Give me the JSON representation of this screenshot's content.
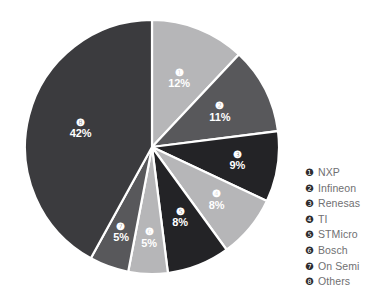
{
  "chart_data": {
    "type": "pie",
    "title": "",
    "subtitle": "",
    "xlabel": "",
    "ylabel": "",
    "grid": false,
    "legend_position": "right",
    "start_angle_deg": 0,
    "direction": "clockwise",
    "categories": [
      "NXP",
      "Infineon",
      "Renesas",
      "TI",
      "STMicro",
      "Bosch",
      "On Semi",
      "Others"
    ],
    "values": [
      12,
      11,
      9,
      8,
      8,
      5,
      5,
      42
    ],
    "value_labels": [
      "12%",
      "11%",
      "9%",
      "8%",
      "8%",
      "5%",
      "5%",
      "42%"
    ],
    "slice_markers": [
      "❶",
      "❷",
      "❸",
      "❹",
      "❺",
      "❻",
      "❼",
      "❽"
    ],
    "colors": [
      "#b6b6b8",
      "#58585b",
      "#232326",
      "#b6b6b8",
      "#232326",
      "#b6b6b8",
      "#58585b",
      "#3b3b3e"
    ],
    "slices": [
      {
        "marker": "❶",
        "label": "NXP",
        "value": 12,
        "value_label": "12%",
        "color": "#b6b6b8"
      },
      {
        "marker": "❷",
        "label": "Infineon",
        "value": 11,
        "value_label": "11%",
        "color": "#58585b"
      },
      {
        "marker": "❸",
        "label": "Renesas",
        "value": 9,
        "value_label": "9%",
        "color": "#232326"
      },
      {
        "marker": "❹",
        "label": "TI",
        "value": 8,
        "value_label": "8%",
        "color": "#b6b6b8"
      },
      {
        "marker": "❺",
        "label": "STMicro",
        "value": 8,
        "value_label": "8%",
        "color": "#232326"
      },
      {
        "marker": "❻",
        "label": "Bosch",
        "value": 5,
        "value_label": "5%",
        "color": "#b6b6b8"
      },
      {
        "marker": "❼",
        "label": "On Semi",
        "value": 5,
        "value_label": "5%",
        "color": "#58585b"
      },
      {
        "marker": "❽",
        "label": "Others",
        "value": 42,
        "value_label": "42%",
        "color": "#3b3b3e"
      }
    ]
  },
  "legend": {
    "items": [
      {
        "marker": "❶",
        "label": "NXP"
      },
      {
        "marker": "❷",
        "label": "Infineon"
      },
      {
        "marker": "❸",
        "label": "Renesas"
      },
      {
        "marker": "❹",
        "label": "TI"
      },
      {
        "marker": "❺",
        "label": "STMicro"
      },
      {
        "marker": "❻",
        "label": "Bosch"
      },
      {
        "marker": "❼",
        "label": "On Semi"
      },
      {
        "marker": "❽",
        "label": "Others"
      }
    ]
  }
}
